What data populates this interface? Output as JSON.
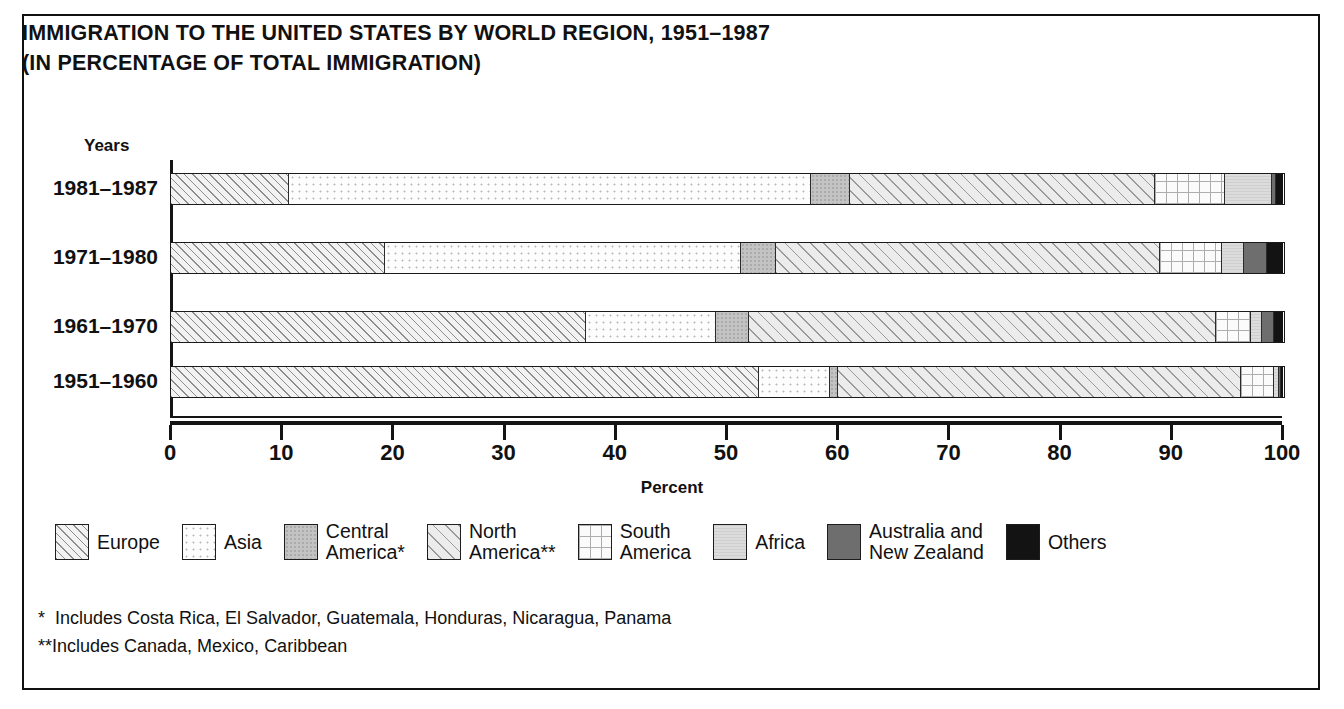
{
  "title": {
    "line1": "IMMIGRATION TO THE UNITED STATES BY WORLD REGION, 1951–1987",
    "line2": "(IN PERCENTAGE OF TOTAL IMMIGRATION)"
  },
  "axis": {
    "y_header": "Years",
    "x_title": "Percent",
    "x_ticks": [
      "0",
      "10",
      "20",
      "30",
      "40",
      "50",
      "60",
      "70",
      "80",
      "90",
      "100"
    ]
  },
  "legend": [
    {
      "key": "europe",
      "label": "Europe",
      "swatch": "diagonal-hatch-light"
    },
    {
      "key": "asia",
      "label": "Asia",
      "swatch": "fine-dots"
    },
    {
      "key": "central",
      "label": "Central\nAmerica*",
      "swatch": "solid-mid-gray"
    },
    {
      "key": "north",
      "label": "North\nAmerica**",
      "swatch": "diagonal-hatch-wide"
    },
    {
      "key": "south",
      "label": "South\nAmerica",
      "swatch": "grid-crosshatch"
    },
    {
      "key": "africa",
      "label": "Africa",
      "swatch": "solid-light-gray"
    },
    {
      "key": "australia",
      "label": "Australia and\nNew Zealand",
      "swatch": "solid-dark-gray"
    },
    {
      "key": "others",
      "label": "Others",
      "swatch": "solid-black"
    }
  ],
  "notes": [
    "*  Includes Costa Rica, El Salvador, Guatemala, Honduras, Nicaragua, Panama",
    "**Includes Canada, Mexico, Caribbean"
  ],
  "rows": [
    {
      "label": "1981–1987"
    },
    {
      "label": "1971–1980"
    },
    {
      "label": "1961–1970"
    },
    {
      "label": "1951–1960"
    }
  ],
  "colors": {
    "ink": "#111111",
    "central_america": "#c3c3c3",
    "africa": "#dcdcdc",
    "australia": "#6e6e6e",
    "others": "#131313",
    "background": "#ffffff"
  },
  "chart_data": {
    "type": "bar",
    "orientation": "horizontal",
    "stacked": true,
    "normalized_percent": true,
    "title": "IMMIGRATION TO THE UNITED STATES BY WORLD REGION, 1951–1987 (IN PERCENTAGE OF TOTAL IMMIGRATION)",
    "xlabel": "Percent",
    "ylabel": "Years",
    "xlim": [
      0,
      100
    ],
    "xticks": [
      0,
      10,
      20,
      30,
      40,
      50,
      60,
      70,
      80,
      90,
      100
    ],
    "grid": false,
    "legend_position": "bottom",
    "categories": [
      "1981–1987",
      "1971–1980",
      "1961–1970",
      "1951–1960"
    ],
    "series": [
      {
        "name": "Europe",
        "values": [
          10.6,
          19.2,
          37.3,
          52.9
        ]
      },
      {
        "name": "Asia",
        "values": [
          47.0,
          32.1,
          11.7,
          6.4
        ]
      },
      {
        "name": "Central America*",
        "values": [
          3.5,
          3.1,
          3.0,
          0.7
        ]
      },
      {
        "name": "North America**",
        "values": [
          27.4,
          34.5,
          42.0,
          36.2
        ]
      },
      {
        "name": "South America",
        "values": [
          6.3,
          5.6,
          3.1,
          3.0
        ]
      },
      {
        "name": "Africa",
        "values": [
          4.2,
          2.0,
          1.0,
          0.4
        ]
      },
      {
        "name": "Australia and New Zealand",
        "values": [
          0.4,
          2.1,
          1.1,
          0.2
        ]
      },
      {
        "name": "Others",
        "values": [
          0.6,
          1.4,
          0.8,
          0.2
        ]
      }
    ]
  }
}
